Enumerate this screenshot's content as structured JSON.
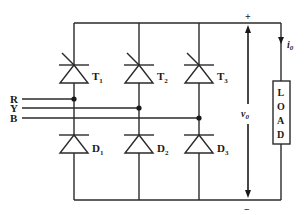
{
  "diagram": {
    "inputs": [
      {
        "label": "R",
        "y": 99
      },
      {
        "label": "Y",
        "y": 108
      },
      {
        "label": "B",
        "y": 118
      }
    ],
    "thyristors": [
      {
        "label": "T",
        "sub": "1",
        "x": 74
      },
      {
        "label": "T",
        "sub": "2",
        "x": 139
      },
      {
        "label": "T",
        "sub": "3",
        "x": 199
      }
    ],
    "diodes": [
      {
        "label": "D",
        "sub": "1",
        "x": 74
      },
      {
        "label": "D",
        "sub": "2",
        "x": 139
      },
      {
        "label": "D",
        "sub": "3",
        "x": 199
      }
    ],
    "output_voltage": {
      "label": "v",
      "sub": "0",
      "plus": "+",
      "minus": "−"
    },
    "output_current": {
      "label": "i",
      "sub": "0"
    },
    "load": {
      "letters": [
        "L",
        "O",
        "A",
        "D"
      ]
    },
    "colors": {
      "wire": "#2a2a2a",
      "background": "#ffffff"
    }
  }
}
